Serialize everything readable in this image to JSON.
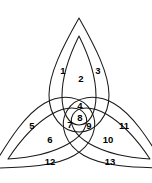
{
  "figure": {
    "background_color": "#ffffff",
    "stroke_color": "#1a1a1a",
    "label_color": "#000000",
    "stroke_width": 1.05,
    "width": 152,
    "height": 183,
    "center": {
      "x": 79,
      "y": 118
    },
    "petal_count": 3,
    "contours_per_petal": 2,
    "petal_rotations_deg": [
      0,
      120,
      240
    ]
  },
  "regions": [
    {
      "id": 1,
      "label": "1",
      "x": 63,
      "y": 71,
      "size": "normal"
    },
    {
      "id": 2,
      "label": "2",
      "x": 81,
      "y": 79,
      "size": "normal"
    },
    {
      "id": 3,
      "label": "3",
      "x": 98,
      "y": 71,
      "size": "normal"
    },
    {
      "id": 4,
      "label": "4",
      "x": 80,
      "y": 106,
      "size": "normal"
    },
    {
      "id": 5,
      "label": "5",
      "x": 32,
      "y": 126,
      "size": "normal"
    },
    {
      "id": 6,
      "label": "6",
      "x": 50,
      "y": 140,
      "size": "normal"
    },
    {
      "id": 7,
      "label": "7",
      "x": 70,
      "y": 125,
      "size": "normal"
    },
    {
      "id": 8,
      "label": "8",
      "x": 80,
      "y": 118,
      "size": "normal"
    },
    {
      "id": 9,
      "label": "9",
      "x": 89,
      "y": 126,
      "size": "normal"
    },
    {
      "id": 10,
      "label": "10",
      "x": 108,
      "y": 140,
      "size": "normal"
    },
    {
      "id": 11,
      "label": "11",
      "x": 124,
      "y": 126,
      "size": "normal"
    },
    {
      "id": 12,
      "label": "12",
      "x": 50,
      "y": 162,
      "size": "normal"
    },
    {
      "id": 13,
      "label": "13",
      "x": 110,
      "y": 162,
      "size": "normal"
    }
  ],
  "geometry": {
    "outer_petal_half_width": 30,
    "outer_petal_length": 100,
    "inner_petal_half_width": 17,
    "inner_petal_length": 80,
    "note": "Each petal is a lens/pointed-oval built from two mirrored quadratic arcs meeting at a sharp apex; the inner contour is a scaled copy sharing the same axis."
  }
}
